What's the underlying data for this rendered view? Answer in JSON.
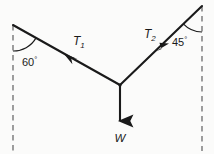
{
  "figure": {
    "background_color": "#fbfbfa",
    "stroke_color": "#1a1a1a",
    "dash_color": "#8c8c8c",
    "width": 214,
    "height": 154,
    "anchors": {
      "left": {
        "x": 13,
        "y": 25
      },
      "right": {
        "x": 202,
        "y": 6
      },
      "junction": {
        "x": 120,
        "y": 85
      }
    },
    "angles": {
      "left": {
        "value": "60",
        "degree_symbol": "°",
        "full": "60°",
        "x": 30,
        "y": 62,
        "arc_radius": 26
      },
      "right": {
        "value": "45",
        "degree_symbol": "°",
        "full": "45°",
        "x": 180,
        "y": 42,
        "arc_radius": 26
      }
    },
    "forces": [
      {
        "id": "T1",
        "label": "T",
        "subscript": "1",
        "label_x": 79,
        "label_y": 45,
        "arrow_direction": "down-left",
        "from": {
          "x": 120,
          "y": 85
        },
        "to": {
          "x": 13,
          "y": 25
        }
      },
      {
        "id": "T2",
        "label": "T",
        "subscript": "2",
        "label_x": 150,
        "label_y": 38,
        "arrow_direction": "up-right",
        "from": {
          "x": 120,
          "y": 85
        },
        "to": {
          "x": 202,
          "y": 6
        }
      },
      {
        "id": "W",
        "label": "W",
        "subscript": "",
        "label_x": 120,
        "label_y": 140,
        "arrow_direction": "down",
        "from": {
          "x": 120,
          "y": 85
        },
        "to": {
          "x": 120,
          "y": 127
        }
      }
    ],
    "dashed_lines": [
      {
        "id": "left-vertical",
        "x": 13,
        "y1": 25,
        "y2": 151
      },
      {
        "id": "right-vertical",
        "x": 202,
        "y1": 6,
        "y2": 151
      }
    ]
  }
}
